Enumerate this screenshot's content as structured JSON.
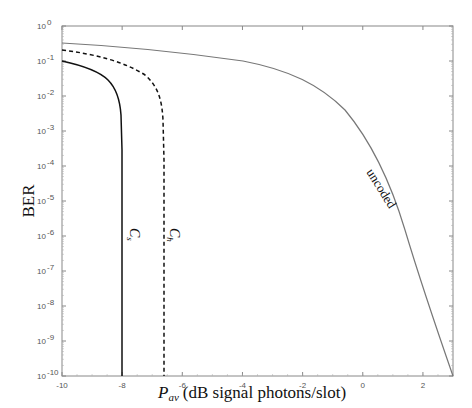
{
  "chart_data": {
    "type": "line",
    "title": "",
    "xlabel": "P_av (dB signal photons/slot)",
    "xlabel_main": "P",
    "xlabel_sub": "av",
    "xlabel_rest": " (dB signal photons/slot)",
    "ylabel": "BER",
    "xlim": [
      -10,
      3
    ],
    "ylim": [
      1e-10,
      1
    ],
    "yscale": "log",
    "grid": false,
    "legend": "none (inline curve labels)",
    "x_ticks": [
      "-10",
      "-8",
      "-6",
      "-4",
      "-2",
      "0",
      "2"
    ],
    "y_ticks": [
      "10^0",
      "10^-1",
      "10^-2",
      "10^-3",
      "10^-4",
      "10^-5",
      "10^-6",
      "10^-7",
      "10^-8",
      "10^-9",
      "10^-10"
    ],
    "series": [
      {
        "name": "uncoded",
        "style": "solid gray",
        "x": [
          -10,
          -8,
          -6,
          -4,
          -2,
          0,
          1,
          2,
          3
        ],
        "y": [
          0.33,
          0.28,
          0.2,
          0.1,
          0.025,
          0.0005,
          1.5e-05,
          1e-07,
          1e-10
        ]
      },
      {
        "name": "C_s",
        "style": "solid black",
        "x": [
          -10,
          -9.5,
          -9,
          -8.5,
          -8.2,
          -8.05,
          -8.0,
          -8.0
        ],
        "y": [
          0.1,
          0.07,
          0.04,
          0.012,
          0.002,
          0.0003,
          1e-06,
          1e-10
        ]
      },
      {
        "name": "C_h",
        "style": "dashed black",
        "x": [
          -10,
          -9,
          -8,
          -7.3,
          -6.9,
          -6.7,
          -6.6,
          -6.6
        ],
        "y": [
          0.2,
          0.16,
          0.1,
          0.04,
          0.008,
          0.0005,
          1e-06,
          1e-10
        ]
      }
    ],
    "annotations": [
      {
        "text": "uncoded",
        "near": [
          -1.5,
          1e-05
        ]
      },
      {
        "text": "C_s",
        "near": [
          -7.6,
          3e-07
        ]
      },
      {
        "text": "C_h",
        "near": [
          -6.2,
          3e-07
        ]
      }
    ]
  },
  "labels": {
    "y_title": "BER",
    "x_title_main": "P",
    "x_title_sub": "av",
    "x_title_rest": "(dB signal photons/slot)",
    "ann_uncoded": "uncoded",
    "ann_cs_main": "C",
    "ann_cs_sub": "s",
    "ann_ch_main": "C",
    "ann_ch_sub": "h",
    "xt": [
      "-10",
      "-8",
      "-6",
      "-4",
      "-2",
      "0",
      "2"
    ],
    "yt_base": "10",
    "yt_exp": [
      "0",
      "-1",
      "-2",
      "-3",
      "-4",
      "-5",
      "-6",
      "-7",
      "-8",
      "-9",
      "-10"
    ]
  }
}
